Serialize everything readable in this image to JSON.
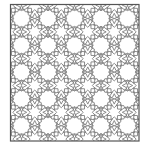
{
  "figure": {
    "type": "islamic-geometric-star-pattern",
    "width": 145,
    "height": 147,
    "background": "#ffffff",
    "frame": {
      "x": 10.5,
      "y": 4.5,
      "w": 128.5,
      "h": 136.5,
      "stroke": "#555555",
      "stroke_width": 1.2
    },
    "grid": {
      "origin_x": 21.5,
      "origin_y": 18.5,
      "step_x": 26.5,
      "step_y": 26.8,
      "cols": 5,
      "rows": 5
    },
    "rosette": {
      "points": 12,
      "outer_radius": 13.2,
      "inner_radius": 8.4,
      "blank_radius": 7.6
    },
    "interstitial_star": {
      "points": 8,
      "outer_radius": 8.2,
      "inner_radius": 4.6
    },
    "line_color": "#808080",
    "line_width": 0.9
  }
}
